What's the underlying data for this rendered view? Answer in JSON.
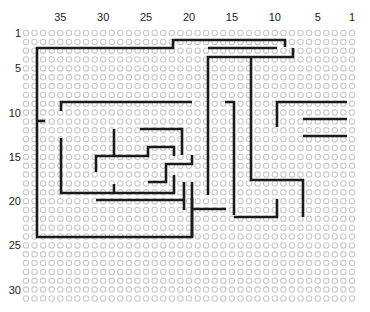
{
  "diagram": {
    "type": "perfboard-wiring-layout",
    "grid": {
      "columns": 39,
      "rows": 31,
      "col1_x": 352,
      "col_pitch": 8.58,
      "row1_y": 33,
      "row_pitch": 8.85,
      "hole_radius": 2.7,
      "hole_color": "#c9c9c9"
    },
    "column_labels": [
      {
        "text": "35",
        "col": 35
      },
      {
        "text": "30",
        "col": 30
      },
      {
        "text": "25",
        "col": 25
      },
      {
        "text": "20",
        "col": 20
      },
      {
        "text": "15",
        "col": 15
      },
      {
        "text": "10",
        "col": 10
      },
      {
        "text": "5",
        "col": 5
      },
      {
        "text": "1",
        "col": 1
      }
    ],
    "row_labels": [
      {
        "text": "1",
        "row": 1
      },
      {
        "text": "5",
        "row": 5
      },
      {
        "text": "10",
        "row": 10
      },
      {
        "text": "15",
        "row": 15
      },
      {
        "text": "20",
        "row": 20
      },
      {
        "text": "25",
        "row": 25
      },
      {
        "text": "30",
        "row": 30
      }
    ],
    "wire_color": "#1a1a1a",
    "wires": [
      {
        "id": "w1",
        "points": [
          [
            285,
            47
          ],
          [
            285,
            40
          ],
          [
            173,
            40
          ],
          [
            173,
            48
          ],
          [
            37,
            48
          ],
          [
            37,
            237
          ],
          [
            192,
            237
          ],
          [
            192,
            198
          ]
        ]
      },
      {
        "id": "w2",
        "points": [
          [
            208,
            48
          ],
          [
            277,
            48
          ]
        ]
      },
      {
        "id": "w3",
        "points": [
          [
            208,
            195
          ],
          [
            208,
            57
          ],
          [
            293,
            57
          ],
          [
            293,
            48
          ]
        ]
      },
      {
        "id": "w4",
        "points": [
          [
            251,
            57
          ],
          [
            251,
            180
          ],
          [
            303,
            180
          ],
          [
            303,
            217
          ]
        ]
      },
      {
        "id": "w5",
        "points": [
          [
            61,
            111
          ],
          [
            61,
            102
          ],
          [
            192,
            102
          ]
        ]
      },
      {
        "id": "w6",
        "points": [
          [
            225,
            102
          ],
          [
            234,
            102
          ],
          [
            234,
            215
          ]
        ]
      },
      {
        "id": "w7",
        "points": [
          [
            277,
            127
          ],
          [
            277,
            102
          ],
          [
            347,
            102
          ]
        ]
      },
      {
        "id": "w8",
        "points": [
          [
            303,
            119
          ],
          [
            347,
            119
          ]
        ]
      },
      {
        "id": "w9",
        "points": [
          [
            303,
            136
          ],
          [
            347,
            136
          ]
        ]
      },
      {
        "id": "w10",
        "points": [
          [
            37,
            121
          ],
          [
            45,
            121
          ]
        ]
      },
      {
        "id": "w11",
        "points": [
          [
            114,
            129
          ],
          [
            114,
            156
          ]
        ]
      },
      {
        "id": "w12",
        "points": [
          [
            140,
            129
          ],
          [
            182,
            129
          ],
          [
            182,
            155
          ]
        ]
      },
      {
        "id": "w13",
        "points": [
          [
            96,
            172
          ],
          [
            96,
            156
          ],
          [
            148,
            156
          ],
          [
            148,
            147
          ],
          [
            174,
            147
          ],
          [
            174,
            156
          ]
        ]
      },
      {
        "id": "w14",
        "points": [
          [
            61,
            138
          ],
          [
            61,
            193
          ],
          [
            174,
            193
          ],
          [
            174,
            175
          ]
        ]
      },
      {
        "id": "w15",
        "points": [
          [
            114,
            193
          ],
          [
            114,
            184
          ]
        ]
      },
      {
        "id": "w16",
        "points": [
          [
            148,
            182
          ],
          [
            166,
            182
          ],
          [
            166,
            164
          ],
          [
            192,
            164
          ],
          [
            192,
            155
          ]
        ]
      },
      {
        "id": "w17",
        "points": [
          [
            184,
            182
          ],
          [
            184,
            210
          ]
        ]
      },
      {
        "id": "w18",
        "points": [
          [
            96,
            200
          ],
          [
            184,
            200
          ]
        ]
      },
      {
        "id": "w19",
        "points": [
          [
            192,
            182
          ],
          [
            192,
            237
          ]
        ]
      },
      {
        "id": "w20",
        "points": [
          [
            192,
            209
          ],
          [
            226,
            209
          ]
        ]
      },
      {
        "id": "w21",
        "points": [
          [
            234,
            217
          ],
          [
            277,
            217
          ],
          [
            277,
            199
          ]
        ]
      }
    ]
  }
}
